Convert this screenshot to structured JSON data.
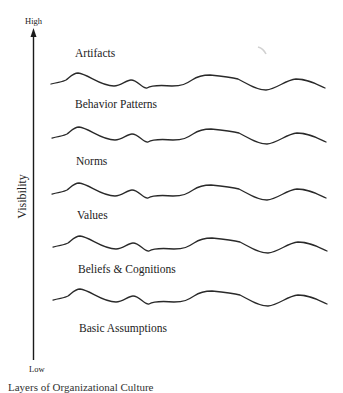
{
  "diagram": {
    "axis": {
      "title": "Visibility",
      "high_label": "High",
      "low_label": "Low",
      "direction": "up"
    },
    "layers": [
      {
        "label": "Artifacts"
      },
      {
        "label": "Behavior Patterns"
      },
      {
        "label": "Norms"
      },
      {
        "label": "Values"
      },
      {
        "label": "Beliefs & Cognitions"
      },
      {
        "label": "Basic Assumptions"
      }
    ],
    "caption": "Layers of Organizational Culture",
    "colors": {
      "line": "#2a2a2a",
      "text": "#222222",
      "background": "#ffffff"
    }
  }
}
